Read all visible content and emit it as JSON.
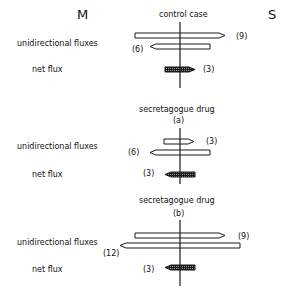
{
  "sides": {
    "left": "M",
    "right": "S"
  },
  "colors": {
    "ink": "#1a1a1a",
    "background": "#ffffff"
  },
  "panels": [
    {
      "title": "control case",
      "subtitle": "",
      "row_labels": {
        "unidirectional": "unidirectional fluxes",
        "net": "net flux"
      },
      "fluxes": [
        {
          "kind": "unidirectional",
          "direction": "right",
          "value": 9,
          "label": "(9)"
        },
        {
          "kind": "unidirectional",
          "direction": "left",
          "value": 6,
          "label": "(6)"
        },
        {
          "kind": "net",
          "direction": "right",
          "value": 3,
          "label": "(3)"
        }
      ]
    },
    {
      "title": "secretagogue drug",
      "subtitle": "(a)",
      "row_labels": {
        "unidirectional": "unidirectional fluxes",
        "net": "net flux"
      },
      "fluxes": [
        {
          "kind": "unidirectional",
          "direction": "right",
          "value": 3,
          "label": "(3)"
        },
        {
          "kind": "unidirectional",
          "direction": "left",
          "value": 6,
          "label": "(6)"
        },
        {
          "kind": "net",
          "direction": "left",
          "value": 3,
          "label": "(3)"
        }
      ]
    },
    {
      "title": "secretagogue drug",
      "subtitle": "(b)",
      "row_labels": {
        "unidirectional": "unidirectional fluxes",
        "net": "net flux"
      },
      "fluxes": [
        {
          "kind": "unidirectional",
          "direction": "right",
          "value": 9,
          "label": "(9)"
        },
        {
          "kind": "unidirectional",
          "direction": "left",
          "value": 12,
          "label": "(12)"
        },
        {
          "kind": "net",
          "direction": "left",
          "value": 3,
          "label": "(3)"
        }
      ]
    }
  ]
}
